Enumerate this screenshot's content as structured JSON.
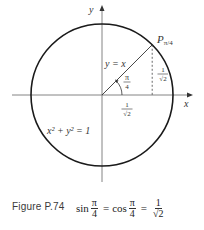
{
  "figure": {
    "axis_labels": {
      "x": "x",
      "y": "y"
    },
    "point_label": {
      "main": "P",
      "subscript": "π/4"
    },
    "line_label": "y = x",
    "angle_label": {
      "num": "π",
      "den": "4"
    },
    "vertical_segment_label": {
      "num": "1",
      "den": "√2"
    },
    "horizontal_segment_label": {
      "num": "1",
      "den": "√2"
    },
    "circle_equation": "x² + y² = 1",
    "colors": {
      "circle": "#1a1a1a",
      "axes": "#555555",
      "text": "#333333"
    }
  },
  "caption": {
    "label": "Figure P.74",
    "formula": {
      "sin": "sin",
      "cos": "cos",
      "frac1": {
        "num": "π",
        "den": "4"
      },
      "frac2": {
        "num": "π",
        "den": "4"
      },
      "frac3": {
        "num": "1",
        "den": "√2"
      },
      "equals": "="
    }
  }
}
